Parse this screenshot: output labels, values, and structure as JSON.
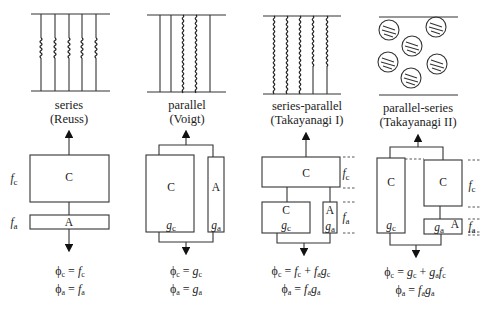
{
  "panels": [
    {
      "id": "series",
      "title": "series",
      "subtitle": "(Reuss)",
      "boxes": [
        {
          "label": "C"
        },
        {
          "label": "A"
        }
      ],
      "side_labels": {
        "fc": "f",
        "fc_sub": "c",
        "fa": "f",
        "fa_sub": "a"
      },
      "eq1": "ϕc = fc",
      "eq2": "ϕa = fa"
    },
    {
      "id": "parallel",
      "title": "parallel",
      "subtitle": "(Voigt)",
      "boxes": [
        {
          "label": "C",
          "weight": "g",
          "weight_sub": "c"
        },
        {
          "label": "A",
          "weight": "g",
          "weight_sub": "a"
        }
      ],
      "eq1": "ϕc = gc",
      "eq2": "ϕa = ga"
    },
    {
      "id": "series-parallel",
      "title": "series-parallel",
      "subtitle": "(Takayanagi I)",
      "boxes": [
        {
          "label": "C"
        },
        {
          "label": "C",
          "weight": "g",
          "weight_sub": "c"
        },
        {
          "label": "A",
          "weight": "g",
          "weight_sub": "a"
        }
      ],
      "side_labels": {
        "fc": "f",
        "fc_sub": "c",
        "fa": "f",
        "fa_sub": "a"
      },
      "eq1": "ϕc = fc + fagc",
      "eq2": "ϕa = faga"
    },
    {
      "id": "parallel-series",
      "title": "parallel-series",
      "subtitle": "(Takayanagi II)",
      "boxes": [
        {
          "label": "C",
          "weight": "g",
          "weight_sub": "c"
        },
        {
          "label": "C"
        },
        {
          "label": "A",
          "weight": "g",
          "weight_sub": "a"
        }
      ],
      "side_labels": {
        "fc": "f",
        "fc_sub": "c",
        "fa": "f",
        "fa_sub": "a"
      },
      "eq1": "ϕc = gc + gafc",
      "eq2": "ϕa = faga"
    }
  ],
  "symbols": {
    "phi": "ϕ",
    "eq": "=",
    "plus": "+",
    "f": "f",
    "g": "g",
    "c": "c",
    "a": "a"
  }
}
